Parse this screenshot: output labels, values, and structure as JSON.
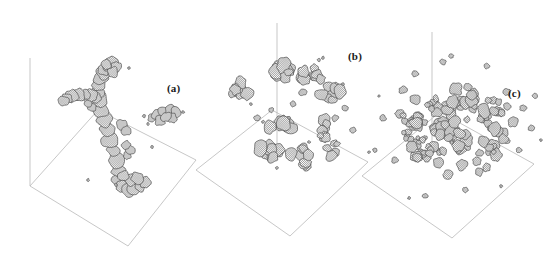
{
  "figure": {
    "background_color": "#ffffff",
    "axis_color": "#b9b9b9",
    "mesh_line_color": "#3c3c3c",
    "blob_fill_color": "#ffffff",
    "label_color": "#1a1a1a",
    "width": 552,
    "height": 268
  },
  "panels": [
    {
      "id": "a",
      "label": "(a)",
      "label_x": 167,
      "label_y": 82,
      "description": "single large spanning percolating cluster with branching arms plus one small satellite cluster",
      "cluster_count": 2,
      "morphology": "percolating-network",
      "axis": {
        "x": 30,
        "y_top": 58,
        "y_bottom": 186
      },
      "base_plane": [
        {
          "x": 30,
          "y": 186
        },
        {
          "x": 128,
          "y": 246
        },
        {
          "x": 196,
          "y": 160
        },
        {
          "x": 98,
          "y": 110
        }
      ]
    },
    {
      "id": "b",
      "label": "(b)",
      "label_x": 348,
      "label_y": 50,
      "description": "several medium sized fragmented clusters distributed above the base plane",
      "cluster_count": 9,
      "morphology": "fragmented-medium-clusters",
      "axis": {
        "x": 277,
        "y_top": 23,
        "y_bottom": 158
      },
      "base_plane": [
        {
          "x": 196,
          "y": 170
        },
        {
          "x": 290,
          "y": 236
        },
        {
          "x": 368,
          "y": 162
        },
        {
          "x": 272,
          "y": 110
        }
      ]
    },
    {
      "id": "c",
      "label": "(c)",
      "label_x": 508,
      "label_y": 87,
      "description": "dense gas of many small roughly spherical droplet clusters",
      "cluster_count": 90,
      "morphology": "dispersed-small-droplets",
      "axis": {
        "x": 432,
        "y_top": 32,
        "y_bottom": 150
      },
      "base_plane": [
        {
          "x": 362,
          "y": 176
        },
        {
          "x": 452,
          "y": 238
        },
        {
          "x": 534,
          "y": 164
        },
        {
          "x": 440,
          "y": 112
        }
      ]
    }
  ],
  "chart_data": {
    "type": "scatter",
    "xlabel": "",
    "ylabel": "",
    "grid": false,
    "legend": "none",
    "annotations": [
      "(a)",
      "(b)",
      "(c)"
    ],
    "series": [
      {
        "name": "(a)",
        "cluster_count": 2,
        "mean_cluster_radius": 26,
        "morphology": "percolating-network"
      },
      {
        "name": "(b)",
        "cluster_count": 9,
        "mean_cluster_radius": 13,
        "morphology": "fragmented-medium-clusters"
      },
      {
        "name": "(c)",
        "cluster_count": 90,
        "mean_cluster_radius": 6,
        "morphology": "dispersed-small-droplets"
      }
    ]
  }
}
